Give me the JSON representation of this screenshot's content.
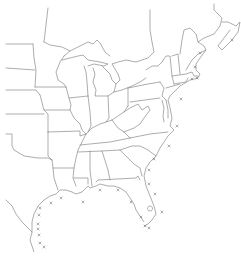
{
  "map": {
    "type": "outline-map",
    "region": "Eastern United States",
    "background_color": "#ffffff",
    "line_color": "#8a8a8a",
    "marker_color": "#7a7a7a",
    "marker_symbol": "x",
    "markers": [
      {
        "id": "nova-scotia",
        "x": 232,
        "y": 40
      },
      {
        "id": "maine-coast",
        "x": 200,
        "y": 53
      },
      {
        "id": "cape-ann",
        "x": 195,
        "y": 67
      },
      {
        "id": "cape-cod",
        "x": 197,
        "y": 78
      },
      {
        "id": "buzzards-bay",
        "x": 192,
        "y": 79
      },
      {
        "id": "new-jersey-offshore",
        "x": 181,
        "y": 99
      },
      {
        "id": "virginia-offshore",
        "x": 177,
        "y": 126
      },
      {
        "id": "north-carolina-offshore",
        "x": 169,
        "y": 146
      },
      {
        "id": "south-carolina-coast",
        "x": 154,
        "y": 159
      },
      {
        "id": "georgia-coast",
        "x": 149,
        "y": 170
      },
      {
        "id": "florida-northeast",
        "x": 149,
        "y": 184
      },
      {
        "id": "florida-east",
        "x": 155,
        "y": 194
      },
      {
        "id": "florida-southeast",
        "x": 162,
        "y": 212
      },
      {
        "id": "florida-keys-east",
        "x": 149,
        "y": 228
      },
      {
        "id": "florida-keys-west",
        "x": 145,
        "y": 226
      },
      {
        "id": "florida-west",
        "x": 131,
        "y": 202
      },
      {
        "id": "florida-southwest",
        "x": 141,
        "y": 217
      },
      {
        "id": "florida-panhandle",
        "x": 118,
        "y": 190
      },
      {
        "id": "alabama-coast",
        "x": 100,
        "y": 190
      },
      {
        "id": "louisiana-east",
        "x": 83,
        "y": 202
      },
      {
        "id": "louisiana-west",
        "x": 61,
        "y": 198
      },
      {
        "id": "texas-upper",
        "x": 51,
        "y": 203
      },
      {
        "id": "texas-coast-1",
        "x": 40,
        "y": 208
      },
      {
        "id": "texas-coast-2",
        "x": 39,
        "y": 215
      },
      {
        "id": "texas-coast-3",
        "x": 38,
        "y": 224
      },
      {
        "id": "texas-coast-4",
        "x": 38,
        "y": 229
      },
      {
        "id": "texas-coast-5",
        "x": 39,
        "y": 235
      },
      {
        "id": "texas-coast-6",
        "x": 40,
        "y": 243
      },
      {
        "id": "texas-coast-7",
        "x": 44,
        "y": 247
      }
    ]
  }
}
